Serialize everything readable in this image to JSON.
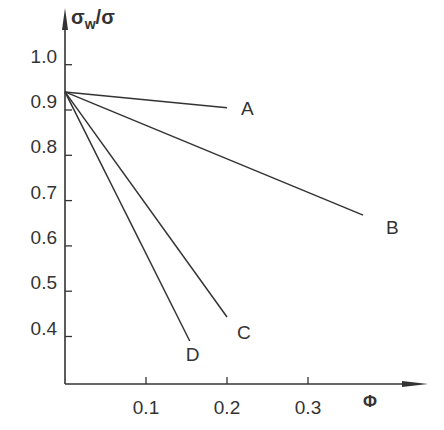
{
  "chart_data": {
    "type": "line",
    "title": "",
    "xlabel": "Φ",
    "ylabel": "σw/σ",
    "ylabel_parts": {
      "main": "σ",
      "sub": "w",
      "rest": "/σ"
    },
    "xlim": [
      0,
      0.42
    ],
    "ylim": [
      0.3,
      1.05
    ],
    "x_ticks": [
      0.1,
      0.2,
      0.3
    ],
    "x_tick_labels": [
      "0.1",
      "0.2",
      "0.3"
    ],
    "y_ticks": [
      1.0,
      0.9,
      0.8,
      0.7,
      0.6,
      0.5,
      0.4
    ],
    "y_tick_labels": [
      "1.0",
      "0.9",
      "0.8",
      "0.7",
      "0.6",
      "0.5",
      "0.4"
    ],
    "grid": false,
    "legend": "inline labels at line ends",
    "series": [
      {
        "name": "A",
        "x": [
          0,
          0.2
        ],
        "y": [
          0.94,
          0.905
        ]
      },
      {
        "name": "B",
        "x": [
          0,
          0.368
        ],
        "y": [
          0.94,
          0.668
        ]
      },
      {
        "name": "C",
        "x": [
          0,
          0.2
        ],
        "y": [
          0.94,
          0.443
        ]
      },
      {
        "name": "D",
        "x": [
          0,
          0.154
        ],
        "y": [
          0.94,
          0.39
        ]
      }
    ],
    "line_color": "#333333"
  }
}
